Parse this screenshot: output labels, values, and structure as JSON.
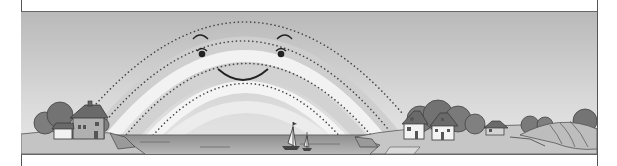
{
  "illustration": {
    "subject": "smiling rainbow over a seaside village",
    "style": "grayscale worksheet illustration with dotted tracing lines",
    "colors": {
      "sky_top": "#b9b9b9",
      "sky_bottom": "#e6e6e6",
      "rainbow_band": "#ffffff",
      "dots": "#444444",
      "water": "#9a9a9a",
      "ground": "#c8c8c8",
      "trees": "#7a7a7a",
      "border": "#555555"
    },
    "rainbow": {
      "dotted_arcs": 4,
      "face": {
        "eyebrows": 2,
        "eyes": 2,
        "mouth": "smile"
      }
    },
    "scene_elements": {
      "left_houses": 2,
      "right_houses": 3,
      "sailboats": 2,
      "fields": "plowed hill on right"
    }
  }
}
